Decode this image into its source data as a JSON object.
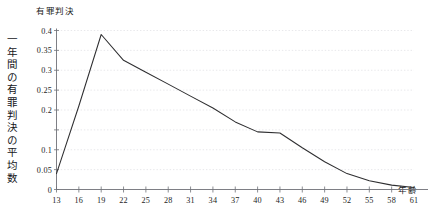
{
  "chart_data": {
    "type": "line",
    "title": "有罪判決",
    "xlabel": "年齢",
    "ylabel": "一年間の有罪判決の平均数",
    "x": [
      13,
      16,
      19,
      22,
      25,
      28,
      31,
      34,
      37,
      40,
      43,
      46,
      49,
      52,
      55,
      58,
      61
    ],
    "values": [
      0.04,
      0.21,
      0.39,
      0.325,
      0.295,
      0.265,
      0.235,
      0.205,
      0.17,
      0.145,
      0.142,
      0.105,
      0.07,
      0.04,
      0.022,
      0.011,
      0.005
    ],
    "series": [
      {
        "name": "有罪判決",
        "values": [
          0.04,
          0.21,
          0.39,
          0.325,
          0.295,
          0.265,
          0.235,
          0.205,
          0.17,
          0.145,
          0.142,
          0.105,
          0.07,
          0.04,
          0.022,
          0.011,
          0.005
        ]
      }
    ],
    "xlim": [
      13,
      61
    ],
    "ylim": [
      0,
      0.4
    ],
    "xticks": [
      13,
      16,
      19,
      22,
      25,
      28,
      31,
      34,
      37,
      40,
      43,
      46,
      49,
      52,
      55,
      58,
      61
    ],
    "xtick_labels": [
      "13",
      "16",
      "19",
      "22",
      "25",
      "28",
      "31",
      "34",
      "37",
      "40",
      "43",
      "46",
      "49",
      "52",
      "55",
      "58",
      "61"
    ],
    "yticks": [
      0,
      0.05,
      0.1,
      0.15,
      0.2,
      0.25,
      0.3,
      0.35,
      0.4
    ],
    "ytick_labels": [
      "0",
      "0.05",
      "0.1",
      "",
      "0.2",
      "0.25",
      "0.3",
      "0.35",
      "0.4"
    ],
    "grid": "horizontal-dotted",
    "legend": "none",
    "line_color": "#2e2e30",
    "grid_color": "#d9d9dd",
    "axis_color": "#6f7177"
  }
}
